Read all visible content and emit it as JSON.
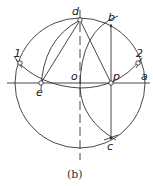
{
  "diagram": {
    "caption": "(b)",
    "points": {
      "d": "d",
      "b": "b",
      "one": "1",
      "two": "2",
      "e": "e",
      "o": "o",
      "p": "p",
      "a": "a",
      "c": "c"
    },
    "colors": {
      "line": "#333333",
      "background": "#ffffff"
    }
  }
}
